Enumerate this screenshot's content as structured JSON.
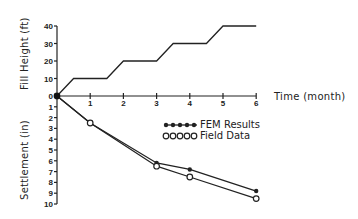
{
  "chart_data": [
    {
      "type": "line",
      "title": "",
      "xlabel": "Time (month)",
      "ylabel": "Fill Height (ft)",
      "xlim": [
        0,
        6
      ],
      "ylim": [
        0,
        40
      ],
      "x_ticks": [
        1,
        2,
        3,
        4,
        5,
        6
      ],
      "y_ticks": [
        0,
        10,
        20,
        30,
        40
      ],
      "grid": false,
      "series": [
        {
          "name": "Fill Height",
          "x": [
            0,
            0.5,
            1.5,
            2,
            3,
            3.5,
            4.5,
            5,
            6
          ],
          "y": [
            0,
            10,
            10,
            20,
            20,
            30,
            30,
            40,
            40
          ]
        }
      ]
    },
    {
      "type": "line",
      "title": "",
      "xlabel": "Time (month)",
      "ylabel": "Settlement (in)",
      "xlim": [
        0,
        6
      ],
      "ylim": [
        0,
        10
      ],
      "y_inverted": true,
      "y_ticks": [
        0,
        1,
        2,
        3,
        4,
        5,
        6,
        7,
        8,
        9,
        10
      ],
      "grid": false,
      "legend_position": "upper right inside lower panel",
      "series": [
        {
          "name": "FEM Results",
          "marker": "filled-star",
          "x": [
            0,
            1,
            3,
            4,
            6
          ],
          "y": [
            0,
            2.5,
            6.2,
            6.8,
            8.8
          ]
        },
        {
          "name": "Field Data",
          "marker": "open-circle",
          "x": [
            0,
            1,
            3,
            4,
            6
          ],
          "y": [
            0,
            2.5,
            6.5,
            7.5,
            9.5
          ]
        }
      ]
    }
  ],
  "labels": {
    "fill_axis_title": "Fill Height (ft)",
    "settlement_axis_title": "Settlement (in)",
    "time_axis_title": "Time (month)",
    "fill_ticks": [
      "0",
      "10",
      "20",
      "30",
      "40"
    ],
    "settlement_ticks": [
      "0",
      "1",
      "2",
      "3",
      "4",
      "5",
      "6",
      "7",
      "8",
      "9",
      "10"
    ],
    "time_ticks": [
      "1",
      "2",
      "3",
      "4",
      "5",
      "6"
    ],
    "legend": [
      "FEM Results",
      "Field Data"
    ]
  }
}
